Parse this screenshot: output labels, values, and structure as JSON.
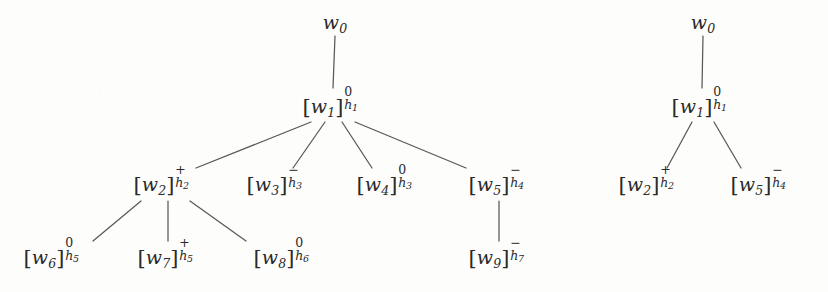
{
  "figure": {
    "type": "two side-by-side dependency trees",
    "background_color": "#fdfdfc",
    "ink_color": "#2a2a2a",
    "edge_color": "#58585a"
  },
  "trees": [
    {
      "id": "left-tree",
      "nodes": [
        {
          "id": "l-w0",
          "base": "w",
          "index": "0",
          "bracketed": false,
          "sign": "",
          "h": "",
          "hindex": "",
          "x": 335,
          "y": 22,
          "label": "w0"
        },
        {
          "id": "l-w1",
          "base": "w",
          "index": "1",
          "bracketed": true,
          "sign": "0",
          "h": "h",
          "hindex": "1",
          "x": 333,
          "y": 105,
          "label": "[w1]0h1"
        },
        {
          "id": "l-w2",
          "base": "w",
          "index": "2",
          "bracketed": true,
          "sign": "+",
          "h": "h",
          "hindex": "2",
          "x": 164,
          "y": 183,
          "label": "[w2]+h2"
        },
        {
          "id": "l-w3",
          "base": "w",
          "index": "3",
          "bracketed": true,
          "sign": "−",
          "h": "h",
          "hindex": "3",
          "x": 277,
          "y": 183,
          "label": "[w3]-h3"
        },
        {
          "id": "l-w4",
          "base": "w",
          "index": "4",
          "bracketed": true,
          "sign": "0",
          "h": "h",
          "hindex": "3",
          "x": 387,
          "y": 183,
          "label": "[w4]0h3"
        },
        {
          "id": "l-w5",
          "base": "w",
          "index": "5",
          "bracketed": true,
          "sign": "−",
          "h": "h",
          "hindex": "4",
          "x": 499,
          "y": 183,
          "label": "[w5]-h4"
        },
        {
          "id": "l-w6",
          "base": "w",
          "index": "6",
          "bracketed": true,
          "sign": "0",
          "h": "h",
          "hindex": "5",
          "x": 54,
          "y": 256,
          "label": "[w6]0h5"
        },
        {
          "id": "l-w7",
          "base": "w",
          "index": "7",
          "bracketed": true,
          "sign": "+",
          "h": "h",
          "hindex": "5",
          "x": 168,
          "y": 256,
          "label": "[w7]+h5"
        },
        {
          "id": "l-w8",
          "base": "w",
          "index": "8",
          "bracketed": true,
          "sign": "0",
          "h": "h",
          "hindex": "6",
          "x": 284,
          "y": 256,
          "label": "[w8]0h6"
        },
        {
          "id": "l-w9",
          "base": "w",
          "index": "9",
          "bracketed": true,
          "sign": "−",
          "h": "h",
          "hindex": "7",
          "x": 499,
          "y": 256,
          "label": "[w9]-h7"
        }
      ],
      "edges": [
        {
          "from": "l-w0",
          "to": "l-w1",
          "x1": 335,
          "y1": 36,
          "x2": 333,
          "y2": 88
        },
        {
          "from": "l-w1",
          "to": "l-w2",
          "x1": 311,
          "y1": 122,
          "x2": 196,
          "y2": 168
        },
        {
          "from": "l-w1",
          "to": "l-w3",
          "x1": 325,
          "y1": 122,
          "x2": 293,
          "y2": 168
        },
        {
          "from": "l-w1",
          "to": "l-w4",
          "x1": 342,
          "y1": 122,
          "x2": 372,
          "y2": 168
        },
        {
          "from": "l-w1",
          "to": "l-w5",
          "x1": 355,
          "y1": 122,
          "x2": 466,
          "y2": 168
        },
        {
          "from": "l-w2",
          "to": "l-w6",
          "x1": 141,
          "y1": 201,
          "x2": 93,
          "y2": 241
        },
        {
          "from": "l-w2",
          "to": "l-w7",
          "x1": 168,
          "y1": 201,
          "x2": 168,
          "y2": 241
        },
        {
          "from": "l-w2",
          "to": "l-w8",
          "x1": 190,
          "y1": 201,
          "x2": 246,
          "y2": 241
        },
        {
          "from": "l-w5",
          "to": "l-w9",
          "x1": 499,
          "y1": 201,
          "x2": 499,
          "y2": 241
        }
      ]
    },
    {
      "id": "right-tree",
      "nodes": [
        {
          "id": "r-w0",
          "base": "w",
          "index": "0",
          "bracketed": false,
          "sign": "",
          "h": "",
          "hindex": "",
          "x": 703,
          "y": 22,
          "label": "w0"
        },
        {
          "id": "r-w1",
          "base": "w",
          "index": "1",
          "bracketed": true,
          "sign": "0",
          "h": "h",
          "hindex": "1",
          "x": 702,
          "y": 105,
          "label": "[w1]0h1"
        },
        {
          "id": "r-w2",
          "base": "w",
          "index": "2",
          "bracketed": true,
          "sign": "+",
          "h": "h",
          "hindex": "2",
          "x": 649,
          "y": 183,
          "label": "[w2]+h2"
        },
        {
          "id": "r-w5",
          "base": "w",
          "index": "5",
          "bracketed": true,
          "sign": "−",
          "h": "h",
          "hindex": "4",
          "x": 761,
          "y": 183,
          "label": "[w5]-h4"
        }
      ],
      "edges": [
        {
          "from": "r-w0",
          "to": "r-w1",
          "x1": 703,
          "y1": 36,
          "x2": 702,
          "y2": 88
        },
        {
          "from": "r-w1",
          "to": "r-w2",
          "x1": 692,
          "y1": 122,
          "x2": 667,
          "y2": 168
        },
        {
          "from": "r-w1",
          "to": "r-w5",
          "x1": 714,
          "y1": 122,
          "x2": 741,
          "y2": 168
        }
      ]
    }
  ]
}
